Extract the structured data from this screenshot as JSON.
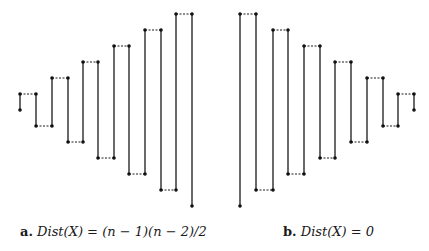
{
  "figures": [
    {
      "id": "a",
      "caption_label": "a.",
      "caption_formula": "Dist(X) = (n − 1)(n − 2)/2",
      "points": [
        [
          20,
          110
        ],
        [
          20,
          94
        ],
        [
          36,
          94
        ],
        [
          36,
          126
        ],
        [
          52,
          126
        ],
        [
          52,
          78
        ],
        [
          68,
          78
        ],
        [
          68,
          142
        ],
        [
          83,
          142
        ],
        [
          83,
          62
        ],
        [
          98,
          62
        ],
        [
          98,
          158
        ],
        [
          114,
          158
        ],
        [
          114,
          46
        ],
        [
          129,
          46
        ],
        [
          129,
          174
        ],
        [
          145,
          174
        ],
        [
          145,
          30
        ],
        [
          161,
          30
        ],
        [
          161,
          190
        ],
        [
          176,
          190
        ],
        [
          176,
          14
        ],
        [
          192,
          14
        ],
        [
          192,
          206
        ]
      ]
    },
    {
      "id": "b",
      "caption_label": "b.",
      "caption_formula": "Dist(X) = 0",
      "points": [
        [
          240,
          206
        ],
        [
          240,
          14
        ],
        [
          256,
          14
        ],
        [
          256,
          190
        ],
        [
          273,
          190
        ],
        [
          273,
          30
        ],
        [
          288,
          30
        ],
        [
          288,
          174
        ],
        [
          304,
          174
        ],
        [
          304,
          46
        ],
        [
          320,
          46
        ],
        [
          320,
          158
        ],
        [
          335,
          158
        ],
        [
          335,
          62
        ],
        [
          351,
          62
        ],
        [
          351,
          142
        ],
        [
          367,
          142
        ],
        [
          367,
          78
        ],
        [
          383,
          78
        ],
        [
          383,
          126
        ],
        [
          398,
          126
        ],
        [
          398,
          94
        ],
        [
          414,
          94
        ],
        [
          414,
          110
        ]
      ]
    }
  ],
  "style": {
    "line_color": "#1a1a1a",
    "dot_color": "#111111"
  }
}
